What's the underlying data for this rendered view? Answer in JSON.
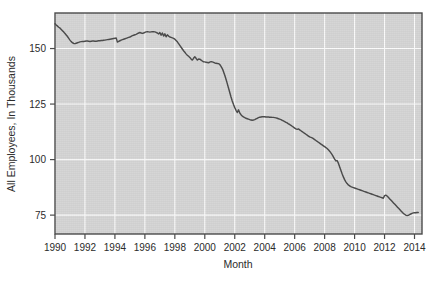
{
  "chart_data": {
    "type": "line",
    "title": "",
    "subtitle": "",
    "xlabel": "Month",
    "ylabel": "All Employees, In Thousands",
    "xlim": [
      1990.0,
      2014.5
    ],
    "ylim": [
      66.5,
      166.0
    ],
    "xticks": [
      1990,
      1992,
      1994,
      1996,
      1998,
      2000,
      2002,
      2004,
      2006,
      2008,
      2010,
      2012,
      2014
    ],
    "xtick_labels": [
      "1990",
      "1992",
      "1994",
      "1996",
      "1998",
      "2000",
      "2002",
      "2004",
      "2006",
      "2008",
      "2010",
      "2012",
      "2014"
    ],
    "yticks": [
      75,
      100,
      125,
      150
    ],
    "ytick_labels": [
      "75",
      "100",
      "125",
      "150"
    ],
    "grid": true,
    "grid_color": "#fbfbfb",
    "plot_background": "#d5d5d5",
    "page_background": "#ffffff",
    "legend": null,
    "legend_position": "none",
    "annotations": [],
    "series": [
      {
        "name": "All Employees",
        "color": "#4a4a4a",
        "x": [
          1990.0,
          1990.083,
          1990.167,
          1990.25,
          1990.333,
          1990.417,
          1990.5,
          1990.583,
          1990.667,
          1990.75,
          1990.833,
          1990.917,
          1991.0,
          1991.083,
          1991.167,
          1991.25,
          1991.333,
          1991.417,
          1991.5,
          1991.583,
          1991.667,
          1991.75,
          1991.833,
          1991.917,
          1992.0,
          1992.083,
          1992.167,
          1992.25,
          1992.333,
          1992.417,
          1992.5,
          1992.583,
          1992.667,
          1992.75,
          1992.833,
          1992.917,
          1993.0,
          1993.083,
          1993.167,
          1993.25,
          1993.333,
          1993.417,
          1993.5,
          1993.583,
          1993.667,
          1993.75,
          1993.833,
          1993.917,
          1994.0,
          1994.083,
          1994.167,
          1994.25,
          1994.333,
          1994.417,
          1994.5,
          1994.583,
          1994.667,
          1994.75,
          1994.833,
          1994.917,
          1995.0,
          1995.083,
          1995.167,
          1995.25,
          1995.333,
          1995.417,
          1995.5,
          1995.583,
          1995.667,
          1995.75,
          1995.833,
          1995.917,
          1996.0,
          1996.083,
          1996.167,
          1996.25,
          1996.333,
          1996.417,
          1996.5,
          1996.583,
          1996.667,
          1996.75,
          1996.833,
          1996.917,
          1997.0,
          1997.083,
          1997.167,
          1997.25,
          1997.333,
          1997.417,
          1997.5,
          1997.583,
          1997.667,
          1997.75,
          1997.833,
          1997.917,
          1998.0,
          1998.083,
          1998.167,
          1998.25,
          1998.333,
          1998.417,
          1998.5,
          1998.583,
          1998.667,
          1998.75,
          1998.833,
          1998.917,
          1999.0,
          1999.083,
          1999.167,
          1999.25,
          1999.333,
          1999.417,
          1999.5,
          1999.583,
          1999.667,
          1999.75,
          1999.833,
          1999.917,
          2000.0,
          2000.083,
          2000.167,
          2000.25,
          2000.333,
          2000.417,
          2000.5,
          2000.583,
          2000.667,
          2000.75,
          2000.833,
          2000.917,
          2001.0,
          2001.083,
          2001.167,
          2001.25,
          2001.333,
          2001.417,
          2001.5,
          2001.583,
          2001.667,
          2001.75,
          2001.833,
          2001.917,
          2002.0,
          2002.083,
          2002.167,
          2002.25,
          2002.333,
          2002.417,
          2002.5,
          2002.583,
          2002.667,
          2002.75,
          2002.833,
          2002.917,
          2003.0,
          2003.083,
          2003.167,
          2003.25,
          2003.333,
          2003.417,
          2003.5,
          2003.583,
          2003.667,
          2003.75,
          2003.833,
          2003.917,
          2004.0,
          2004.083,
          2004.167,
          2004.25,
          2004.333,
          2004.417,
          2004.5,
          2004.583,
          2004.667,
          2004.75,
          2004.833,
          2004.917,
          2005.0,
          2005.083,
          2005.167,
          2005.25,
          2005.333,
          2005.417,
          2005.5,
          2005.583,
          2005.667,
          2005.75,
          2005.833,
          2005.917,
          2006.0,
          2006.083,
          2006.167,
          2006.25,
          2006.333,
          2006.417,
          2006.5,
          2006.583,
          2006.667,
          2006.75,
          2006.833,
          2006.917,
          2007.0,
          2007.083,
          2007.167,
          2007.25,
          2007.333,
          2007.417,
          2007.5,
          2007.583,
          2007.667,
          2007.75,
          2007.833,
          2007.917,
          2008.0,
          2008.083,
          2008.167,
          2008.25,
          2008.333,
          2008.417,
          2008.5,
          2008.583,
          2008.667,
          2008.75,
          2008.833,
          2008.917,
          2009.0,
          2009.083,
          2009.167,
          2009.25,
          2009.333,
          2009.417,
          2009.5,
          2009.583,
          2009.667,
          2009.75,
          2009.833,
          2009.917,
          2010.0,
          2010.083,
          2010.167,
          2010.25,
          2010.333,
          2010.417,
          2010.5,
          2010.583,
          2010.667,
          2010.75,
          2010.833,
          2010.917,
          2011.0,
          2011.083,
          2011.167,
          2011.25,
          2011.333,
          2011.417,
          2011.5,
          2011.583,
          2011.667,
          2011.75,
          2011.833,
          2011.917,
          2012.0,
          2012.083,
          2012.167,
          2012.25,
          2012.333,
          2012.417,
          2012.5,
          2012.583,
          2012.667,
          2012.75,
          2012.833,
          2012.917,
          2013.0,
          2013.083,
          2013.167,
          2013.25,
          2013.333,
          2013.417,
          2013.5,
          2013.583,
          2013.667,
          2013.75,
          2013.833,
          2013.917,
          2014.0,
          2014.083,
          2014.167,
          2014.25
        ],
        "values": [
          161.2,
          160.6,
          160.1,
          159.6,
          159.2,
          158.6,
          158.0,
          157.4,
          156.8,
          156.1,
          155.4,
          154.6,
          153.8,
          153.1,
          152.6,
          152.3,
          152.2,
          152.4,
          152.6,
          152.8,
          153.0,
          153.1,
          153.2,
          153.2,
          153.3,
          153.4,
          153.4,
          153.3,
          153.2,
          153.3,
          153.4,
          153.4,
          153.3,
          153.3,
          153.4,
          153.5,
          153.5,
          153.6,
          153.6,
          153.7,
          153.8,
          153.9,
          154.0,
          154.1,
          154.2,
          154.3,
          154.4,
          154.5,
          154.6,
          154.8,
          152.9,
          153.2,
          153.5,
          153.8,
          154.0,
          154.2,
          154.4,
          154.6,
          154.8,
          155.0,
          155.2,
          155.5,
          155.8,
          156.0,
          156.2,
          156.4,
          156.7,
          157.0,
          157.2,
          157.0,
          156.8,
          157.0,
          157.3,
          157.5,
          157.6,
          157.5,
          157.4,
          157.5,
          157.6,
          157.6,
          157.5,
          157.3,
          157.0,
          156.6,
          157.2,
          156.0,
          157.0,
          155.6,
          156.6,
          155.3,
          156.2,
          155.6,
          155.2,
          155.0,
          154.8,
          154.6,
          154.2,
          153.6,
          153.0,
          152.2,
          151.4,
          150.6,
          149.8,
          149.0,
          148.3,
          147.6,
          147.0,
          146.5,
          146.0,
          145.3,
          144.8,
          145.6,
          146.3,
          145.6,
          144.8,
          145.3,
          145.2,
          144.8,
          144.4,
          144.0,
          144.0,
          143.8,
          143.7,
          143.6,
          143.9,
          144.1,
          144.0,
          143.8,
          143.5,
          143.4,
          143.3,
          143.2,
          142.8,
          142.0,
          141.0,
          139.6,
          138.0,
          136.2,
          134.2,
          132.2,
          130.2,
          128.2,
          126.4,
          124.8,
          123.4,
          122.2,
          121.2,
          122.4,
          121.0,
          120.2,
          119.6,
          119.2,
          118.9,
          118.6,
          118.4,
          118.2,
          118.0,
          117.8,
          117.7,
          117.8,
          118.0,
          118.3,
          118.6,
          118.9,
          119.1,
          119.2,
          119.3,
          119.3,
          119.3,
          119.2,
          119.2,
          119.2,
          119.1,
          119.1,
          119.0,
          119.0,
          118.9,
          118.8,
          118.6,
          118.4,
          118.2,
          118.0,
          117.7,
          117.4,
          117.1,
          116.8,
          116.5,
          116.1,
          115.8,
          115.4,
          115.0,
          114.6,
          114.2,
          113.8,
          113.6,
          113.8,
          113.4,
          113.0,
          112.6,
          112.2,
          111.8,
          111.4,
          111.0,
          110.6,
          110.2,
          110.0,
          109.8,
          109.4,
          109.0,
          108.6,
          108.2,
          107.8,
          107.4,
          107.0,
          106.6,
          106.2,
          105.8,
          105.4,
          105.0,
          104.4,
          103.8,
          103.0,
          102.2,
          101.2,
          100.2,
          99.4,
          99.6,
          98.4,
          96.8,
          95.2,
          93.6,
          92.2,
          91.0,
          90.0,
          89.2,
          88.6,
          88.2,
          87.8,
          87.6,
          87.4,
          87.2,
          87.0,
          86.8,
          86.6,
          86.4,
          86.2,
          86.0,
          85.8,
          85.6,
          85.4,
          85.2,
          85.0,
          84.8,
          84.6,
          84.4,
          84.2,
          84.0,
          83.8,
          83.6,
          83.4,
          83.2,
          83.0,
          82.8,
          82.6,
          83.8,
          84.0,
          83.6,
          83.0,
          82.4,
          81.8,
          81.2,
          80.6,
          80.0,
          79.4,
          78.8,
          78.2,
          77.6,
          77.0,
          76.4,
          75.8,
          75.4,
          75.0,
          74.8,
          74.9,
          75.2,
          75.5,
          75.8,
          76.0,
          76.1,
          76.1,
          76.2,
          76.2
        ]
      }
    ]
  },
  "axis": {
    "ylabel_text": "All Employees, In Thousands",
    "xlabel_text": "Month"
  }
}
